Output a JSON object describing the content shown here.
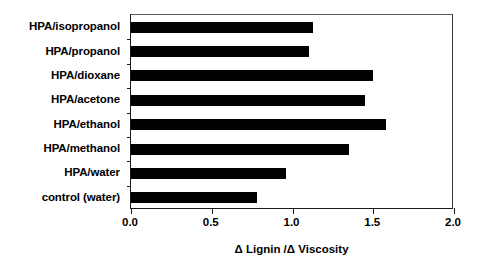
{
  "chart_data": {
    "type": "bar",
    "orientation": "horizontal",
    "title": "",
    "xlabel": "Δ Lignin /Δ Viscosity",
    "ylabel": "",
    "xlim": [
      0.0,
      2.0
    ],
    "grid": false,
    "legend": null,
    "bar_color": "#000000",
    "axis_color": "#000000",
    "xticks": [
      "0.0",
      "0.5",
      "1.0",
      "1.5",
      "2.0"
    ],
    "xtick_values": [
      0.0,
      0.5,
      1.0,
      1.5,
      2.0
    ],
    "categories": [
      "HPA/isopropanol",
      "HPA/propanol",
      "HPA/dioxane",
      "HPA/acetone",
      "HPA/ethanol",
      "HPA/methanol",
      "HPA/water",
      "control (water)"
    ],
    "values": [
      1.13,
      1.1,
      1.5,
      1.45,
      1.58,
      1.35,
      0.96,
      0.78
    ]
  }
}
